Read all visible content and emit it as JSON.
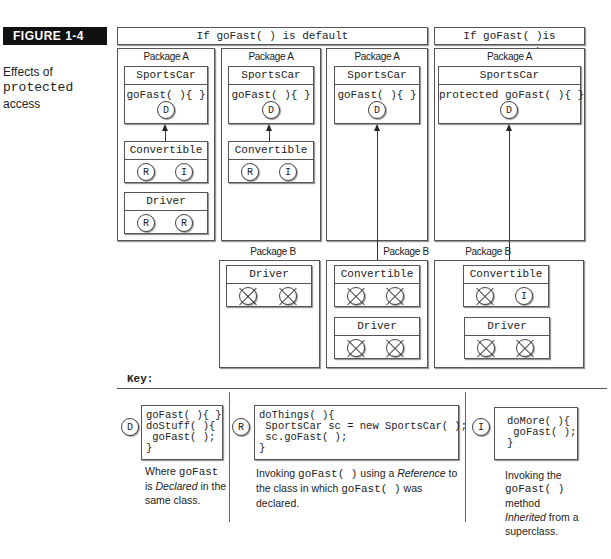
{
  "figure": {
    "label": "FIGURE 1-4",
    "caption_line1": "Effects of",
    "caption_code": "protected",
    "caption_line3": "access"
  },
  "headers": {
    "default": "If goFast( ) is default",
    "protected": "If goFast( )is protected"
  },
  "columns": [
    {
      "package_a": {
        "title": "Package A",
        "sportscar": {
          "name": "SportsCar",
          "method": "goFast( ){ }",
          "badge": "D"
        },
        "convertible": {
          "name": "Convertible",
          "badges": [
            "R",
            "I"
          ]
        },
        "driver": {
          "name": "Driver",
          "badges": [
            "R",
            "R"
          ]
        }
      }
    },
    {
      "package_a": {
        "title": "Package A",
        "sportscar": {
          "name": "SportsCar",
          "method": "goFast( ){ }",
          "badge": "D"
        },
        "convertible": {
          "name": "Convertible",
          "badges": [
            "R",
            "I"
          ]
        }
      },
      "package_b": {
        "title": "Package B",
        "driver": {
          "name": "Driver",
          "badges": [
            "X",
            "X"
          ]
        }
      }
    },
    {
      "package_a": {
        "title": "Package A",
        "sportscar": {
          "name": "SportsCar",
          "method": "goFast( ){ }",
          "badge": "D"
        }
      },
      "package_b": {
        "title": "Package B",
        "convertible": {
          "name": "Convertible",
          "badges": [
            "X",
            "X"
          ]
        },
        "driver": {
          "name": "Driver",
          "badges": [
            "X",
            "X"
          ]
        }
      }
    },
    {
      "package_a": {
        "title": "Package A",
        "sportscar": {
          "name": "SportsCar",
          "method": "protected goFast( ){ }",
          "badge": "D"
        }
      },
      "package_b": {
        "title": "Package B",
        "convertible": {
          "name": "Convertible",
          "badges": [
            "X",
            "I"
          ]
        },
        "driver": {
          "name": "Driver",
          "badges": [
            "X",
            "X"
          ]
        }
      }
    }
  ],
  "key": {
    "title": "Key:",
    "items": [
      {
        "badge": "D",
        "code": "goFast( ){ }\ndoStuff( ){\n goFast( );\n}",
        "desc_1": "Where ",
        "desc_code_1": "goFast",
        "desc_2": "is ",
        "desc_em": "Declared",
        "desc_3": " in the same class."
      },
      {
        "badge": "R",
        "code": "doThings( ){\n SportsCar sc = new SportsCar( );\n sc.goFast( );\n}",
        "desc_1": "Invoking ",
        "desc_code_1": "goFast( )",
        "desc_2": " using a ",
        "desc_em": "Reference",
        "desc_3": " to the class in which ",
        "desc_code_2": "goFast( )",
        "desc_4": " was declared."
      },
      {
        "badge": "I",
        "code": "doMore( ){\n goFast( );\n}",
        "desc_1": "Invoking the",
        "desc_code_1": "goFast( )",
        "desc_2": "method",
        "desc_em": "Inherited",
        "desc_3": " from a superclass."
      }
    ]
  }
}
